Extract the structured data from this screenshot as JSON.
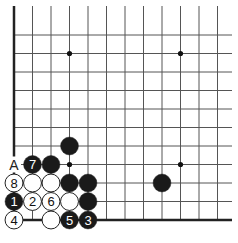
{
  "diagram": {
    "type": "go-board-corner",
    "grid": {
      "columns": 12,
      "rows": 12,
      "origin_x": 14,
      "origin_y": 220,
      "spacing": 18.5,
      "edges": {
        "left": true,
        "bottom": true,
        "top": false,
        "right": false
      }
    },
    "star_points": [
      {
        "col": 3,
        "row": 3
      },
      {
        "col": 3,
        "row": 9
      },
      {
        "col": 9,
        "row": 3
      },
      {
        "col": 9,
        "row": 9
      }
    ],
    "stones": [
      {
        "color": "white",
        "col": 0,
        "row": 0,
        "label": "4"
      },
      {
        "color": "white",
        "col": 2,
        "row": 0,
        "label": ""
      },
      {
        "color": "black",
        "col": 3,
        "row": 0,
        "label": "5"
      },
      {
        "color": "black",
        "col": 4,
        "row": 0,
        "label": "3"
      },
      {
        "color": "black",
        "col": 0,
        "row": 1,
        "label": "1"
      },
      {
        "color": "white",
        "col": 1,
        "row": 1,
        "label": "2"
      },
      {
        "color": "white",
        "col": 2,
        "row": 1,
        "label": "6"
      },
      {
        "color": "white",
        "col": 3,
        "row": 1,
        "label": ""
      },
      {
        "color": "black",
        "col": 4,
        "row": 1,
        "label": ""
      },
      {
        "color": "white",
        "col": 0,
        "row": 2,
        "label": "8"
      },
      {
        "color": "white",
        "col": 1,
        "row": 2,
        "label": ""
      },
      {
        "color": "white",
        "col": 2,
        "row": 2,
        "label": ""
      },
      {
        "color": "black",
        "col": 3,
        "row": 2,
        "label": ""
      },
      {
        "color": "black",
        "col": 4,
        "row": 2,
        "label": ""
      },
      {
        "color": "black",
        "col": 1,
        "row": 3,
        "label": "7"
      },
      {
        "color": "black",
        "col": 2,
        "row": 3,
        "label": ""
      },
      {
        "color": "black",
        "col": 3,
        "row": 4,
        "label": ""
      },
      {
        "color": "black",
        "col": 8,
        "row": 2,
        "label": ""
      }
    ],
    "point_labels": [
      {
        "col": 0,
        "row": 3,
        "text": "A"
      }
    ],
    "colors": {
      "line": "#555555",
      "edge": "#222222",
      "black_stone": "#1a1a1a",
      "white_stone": "#ffffff",
      "stone_outline": "#222222"
    }
  }
}
